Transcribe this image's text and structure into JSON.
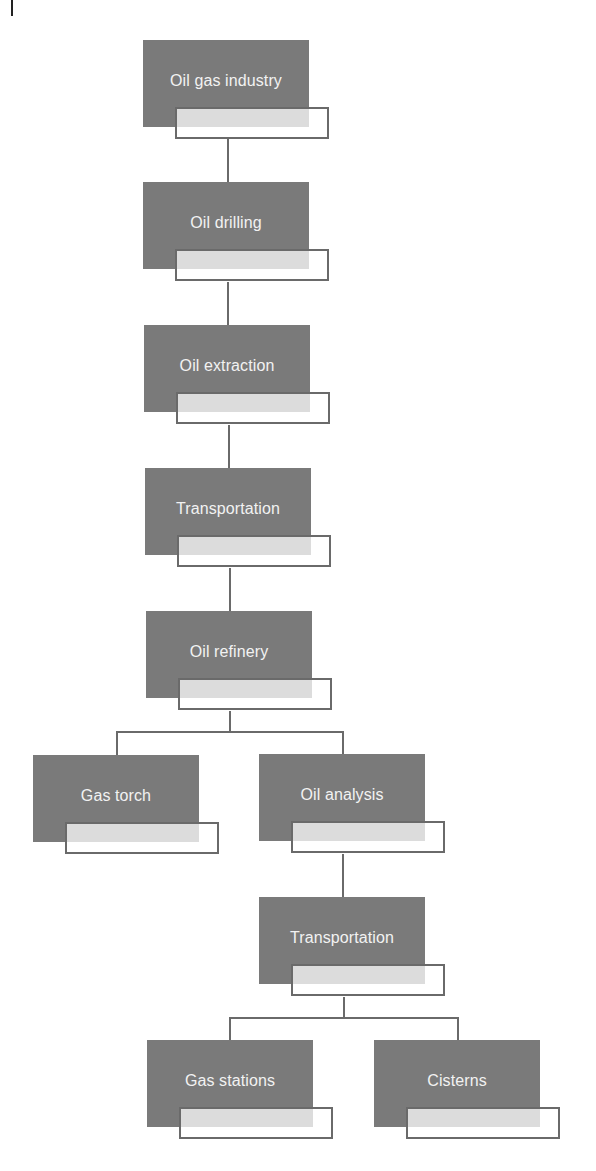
{
  "diagram": {
    "type": "flowchart",
    "nodes": [
      {
        "id": "n1",
        "label": "Oil gas industry"
      },
      {
        "id": "n2",
        "label": "Oil drilling"
      },
      {
        "id": "n3",
        "label": "Oil extraction"
      },
      {
        "id": "n4",
        "label": "Transportation"
      },
      {
        "id": "n5",
        "label": "Oil refinery"
      },
      {
        "id": "n6",
        "label": "Gas torch"
      },
      {
        "id": "n7",
        "label": "Oil analysis"
      },
      {
        "id": "n8",
        "label": "Transportation"
      },
      {
        "id": "n9",
        "label": "Gas stations"
      },
      {
        "id": "n10",
        "label": "Cisterns"
      }
    ],
    "edges": [
      {
        "from": "n1",
        "to": "n2"
      },
      {
        "from": "n2",
        "to": "n3"
      },
      {
        "from": "n3",
        "to": "n4"
      },
      {
        "from": "n4",
        "to": "n5"
      },
      {
        "from": "n5",
        "to": "n6"
      },
      {
        "from": "n5",
        "to": "n7"
      },
      {
        "from": "n7",
        "to": "n8"
      },
      {
        "from": "n8",
        "to": "n9"
      },
      {
        "from": "n8",
        "to": "n10"
      }
    ],
    "colors": {
      "node_fill": "#7a7a7a",
      "node_text": "#f2f2f2",
      "tab_shade": "#dcdcdc",
      "line": "#6a6a6a"
    }
  }
}
